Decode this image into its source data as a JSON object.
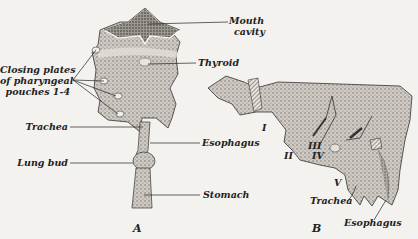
{
  "figure": {
    "panels": [
      {
        "id": "A",
        "label": "A"
      },
      {
        "id": "B",
        "label": "B"
      }
    ],
    "panel_a": {
      "labels": {
        "mouth_cavity_1": "Mouth",
        "mouth_cavity_2": "cavity",
        "thyroid": "Thyroid",
        "closing_plates_1": "Closing plates",
        "closing_plates_2": "of pharyngeal",
        "closing_plates_3": "pouches 1-4",
        "trachea": "Trachea",
        "esophagus": "Esophagus",
        "lung_bud": "Lung bud",
        "stomach": "Stomach"
      }
    },
    "panel_b": {
      "arch_numerals": [
        "I",
        "II",
        "III",
        "IV",
        "V"
      ],
      "labels": {
        "trachea": "Trachea",
        "esophagus": "Esophagus"
      }
    },
    "colors": {
      "background": "#f4f2ee",
      "ink": "#222222",
      "stipple": "#8a8680"
    }
  }
}
